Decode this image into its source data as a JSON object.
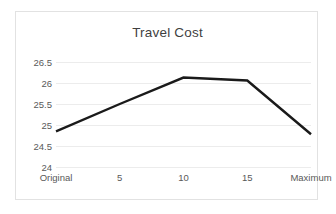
{
  "chart_data": {
    "type": "line",
    "title": "Travel Cost",
    "xlabel": "",
    "ylabel": "",
    "categories": [
      "Original",
      "5",
      "10",
      "15",
      "Maximum"
    ],
    "values": [
      24.85,
      25.5,
      26.13,
      26.06,
      24.78
    ],
    "series": [
      {
        "name": "Travel Cost",
        "values": [
          24.85,
          25.5,
          26.13,
          26.06,
          24.78
        ]
      }
    ],
    "ylim": [
      24,
      26.5
    ],
    "yticks": [
      "26.5",
      "26",
      "25.5",
      "25",
      "24.5",
      "24"
    ],
    "ytick_values": [
      26.5,
      26,
      25.5,
      25,
      24.5,
      24
    ],
    "grid": true,
    "legend": false,
    "legend_position": "none",
    "line_color": "#1a1a1a",
    "grid_color": "#ececec",
    "text_color": "#595959",
    "title_color": "#3f3f3f",
    "border_color": "#e2e2e2",
    "background": "#ffffff"
  }
}
